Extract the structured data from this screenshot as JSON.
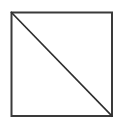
{
  "canvas": {
    "width": 122,
    "height": 128,
    "background_color": "#ffffff"
  },
  "figure": {
    "name": "square-with-diagonal",
    "stroke_color": "#3a3a3a",
    "diagonal_stroke_color": "#2e2e2e",
    "fill_color": "none",
    "square": {
      "x": 11.5,
      "y": 12.5,
      "width": 100.5,
      "height": 103.5,
      "stroke_width": 2
    },
    "diagonal": {
      "x1": 11.5,
      "y1": 12.5,
      "x2": 112,
      "y2": 116,
      "stroke_width": 1.6
    }
  }
}
